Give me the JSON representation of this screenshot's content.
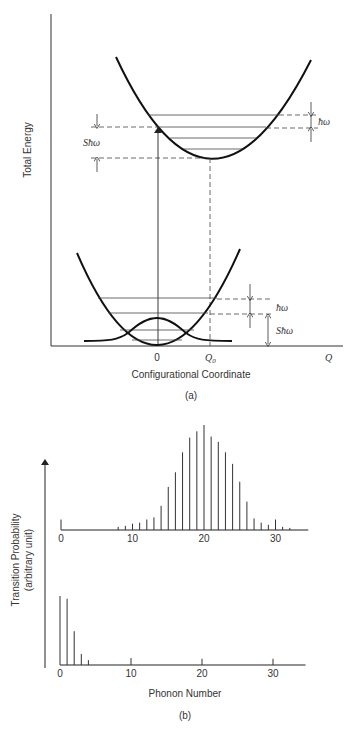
{
  "panel_a": {
    "caption": "(a)",
    "y_axis_label": "Total Energy",
    "x_axis_label": "Configurational Coordinate",
    "x_ticks": [
      "0",
      "Q0",
      "Q"
    ],
    "x_tick_labels": {
      "zero": "0",
      "q0_main": "Q",
      "q0_sub": "0",
      "q": "Q"
    },
    "annotations": {
      "upper_hbar_omega": "ħω",
      "upper_s_hbar_omega": "Sħω",
      "lower_hbar_omega": "ħω",
      "lower_s_hbar_omega": "Sħω"
    },
    "curves": {
      "ground_state": {
        "minimum_at": "0",
        "vibrational_levels": 4
      },
      "excited_state": {
        "minimum_at": "Q0",
        "vibrational_levels": 4
      },
      "ground_wavefunction": "gaussian centered at 0"
    },
    "transition": "vertical arrow from ground-state minimum (Q=0) up to excited-state parabola"
  },
  "panel_b": {
    "caption": "(b)",
    "y_axis_label_line1": "Transition Probability",
    "y_axis_label_line2": "(arbitrary unit)",
    "x_axis_label": "Phonon Number"
  },
  "chart_data": [
    {
      "type": "bar",
      "title": "Large Huang-Rhys factor (S ≈ 20)",
      "xlabel": "Phonon Number",
      "ylabel": "Transition Probability (arbitrary unit)",
      "x_ticks": [
        0,
        10,
        20,
        30
      ],
      "xlim": [
        0,
        35
      ],
      "ylim": [
        0,
        1
      ],
      "x": [
        0,
        8,
        9,
        10,
        11,
        12,
        13,
        14,
        15,
        16,
        17,
        18,
        19,
        20,
        21,
        22,
        23,
        24,
        25,
        26,
        27,
        28,
        29,
        30,
        31,
        32
      ],
      "values": [
        0.1,
        0.03,
        0.04,
        0.06,
        0.07,
        0.1,
        0.12,
        0.23,
        0.41,
        0.55,
        0.74,
        0.88,
        0.94,
        1.0,
        0.89,
        0.84,
        0.74,
        0.63,
        0.46,
        0.27,
        0.11,
        0.07,
        0.05,
        0.1,
        0.03,
        0.02
      ]
    },
    {
      "type": "bar",
      "title": "Small Huang-Rhys factor (S ≈ 1)",
      "xlabel": "Phonon Number",
      "ylabel": "Transition Probability (arbitrary unit)",
      "x_ticks": [
        0,
        10,
        20,
        30
      ],
      "xlim": [
        0,
        35
      ],
      "ylim": [
        0,
        1
      ],
      "x": [
        0,
        1,
        2,
        3,
        4,
        10,
        20,
        30
      ],
      "values": [
        1.0,
        0.96,
        0.49,
        0.16,
        0.07,
        0.1,
        0.09,
        0.09
      ]
    }
  ]
}
